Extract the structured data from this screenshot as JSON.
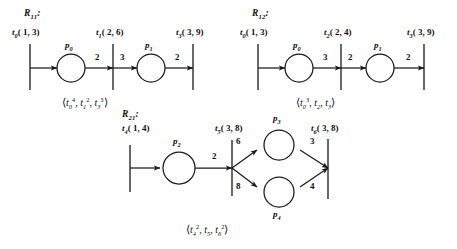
{
  "figure": {
    "type": "petri-net-diagram",
    "background": "#ffffff",
    "ink": "#1a1a1a",
    "nets": [
      {
        "id": "R11",
        "name_base": "R",
        "name_sub": "11",
        "name_colon": ":",
        "transitions": [
          {
            "id": "t0",
            "base": "t",
            "sub": "0",
            "nums": "( 1, 3)"
          },
          {
            "id": "t1",
            "base": "t",
            "sub": "1",
            "nums": "( 2, 6)"
          },
          {
            "id": "t3",
            "base": "t",
            "sub": "3",
            "nums": "( 3, 9)"
          }
        ],
        "places": [
          {
            "id": "p0",
            "base": "p",
            "sub": "0"
          },
          {
            "id": "p1",
            "base": "p",
            "sub": "1"
          }
        ],
        "weights": [
          "2",
          "3",
          "2"
        ],
        "sequence": {
          "open": "⟨",
          "close": "⟩",
          "terms": [
            {
              "base": "t",
              "sub": "0",
              "sup": "4"
            },
            {
              "base": "t",
              "sub": "1",
              "sup": "2"
            },
            {
              "base": "t",
              "sub": "3",
              "sup": "3"
            }
          ]
        }
      },
      {
        "id": "R12",
        "name_base": "R",
        "name_sub": "12",
        "name_colon": ":",
        "transitions": [
          {
            "id": "t0",
            "base": "t",
            "sub": "0",
            "nums": "( 1, 3)"
          },
          {
            "id": "t2",
            "base": "t",
            "sub": "2",
            "nums": "( 2, 4)"
          },
          {
            "id": "t3",
            "base": "t",
            "sub": "3",
            "nums": "( 3, 9)"
          }
        ],
        "places": [
          {
            "id": "p0",
            "base": "p",
            "sub": "0"
          },
          {
            "id": "p1",
            "base": "p",
            "sub": "1"
          }
        ],
        "weights": [
          "3",
          "2",
          "2"
        ],
        "sequence": {
          "open": "⟨",
          "close": "⟩",
          "terms": [
            {
              "base": "t",
              "sub": "0",
              "sup": "3"
            },
            {
              "base": "t",
              "sub": "2",
              "sup": ""
            },
            {
              "base": "t",
              "sub": "3",
              "sup": ""
            }
          ]
        }
      },
      {
        "id": "R21",
        "name_base": "R",
        "name_sub": "21",
        "name_colon": ":",
        "transitions": [
          {
            "id": "t4",
            "base": "t",
            "sub": "4",
            "nums": "( 1, 4)"
          },
          {
            "id": "t5",
            "base": "t",
            "sub": "5",
            "nums": "( 3, 8)"
          },
          {
            "id": "t6",
            "base": "t",
            "sub": "6",
            "nums": "( 3, 8)"
          }
        ],
        "places": [
          {
            "id": "p2",
            "base": "p",
            "sub": "2"
          },
          {
            "id": "p3",
            "base": "p",
            "sub": "3"
          },
          {
            "id": "p4",
            "base": "p",
            "sub": "4"
          }
        ],
        "weights": [
          "2",
          "6",
          "8",
          "3",
          "4"
        ],
        "sequence": {
          "open": "⟨",
          "close": "⟩",
          "terms": [
            {
              "base": "t",
              "sub": "4",
              "sup": "2"
            },
            {
              "base": "t",
              "sub": "5",
              "sup": ""
            },
            {
              "base": "t",
              "sub": "6",
              "sup": "2"
            }
          ]
        }
      }
    ]
  }
}
